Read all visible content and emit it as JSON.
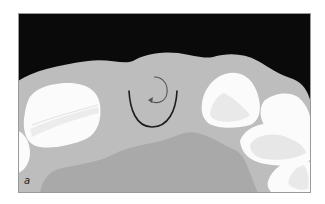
{
  "figure": {
    "panel_label": "a",
    "colors": {
      "background": "#0a0a0a",
      "gingiva": "#bdbdbd",
      "palate": "#a9a9a9",
      "tooth": "#fbfbfb",
      "tooth_shade": "#e6e6e6",
      "suture": "#1c1c1c",
      "arrow": "#555555",
      "frame": "#9a9a9a"
    }
  }
}
